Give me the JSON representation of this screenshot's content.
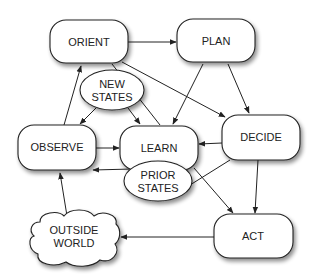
{
  "diagram": {
    "type": "flow",
    "nodes": {
      "orient": {
        "label": "ORIENT",
        "shape": "rounded-rect"
      },
      "plan": {
        "label": "PLAN",
        "shape": "rounded-rect"
      },
      "new_states": {
        "label_line1": "NEW",
        "label_line2": "STATES",
        "shape": "ellipse"
      },
      "observe": {
        "label": "OBSERVE",
        "shape": "rounded-rect"
      },
      "learn": {
        "label": "LEARN",
        "shape": "rounded-rect"
      },
      "decide": {
        "label": "DECIDE",
        "shape": "rounded-rect"
      },
      "prior_states": {
        "label_line1": "PRIOR",
        "label_line2": "STATES",
        "shape": "ellipse"
      },
      "outside_world": {
        "label_line1": "OUTSIDE",
        "label_line2": "WORLD",
        "shape": "cloud"
      },
      "act": {
        "label": "ACT",
        "shape": "rounded-rect"
      }
    },
    "edges": [
      {
        "from": "ORIENT",
        "to": "PLAN"
      },
      {
        "from": "ORIENT",
        "to": "DECIDE"
      },
      {
        "from": "ORIENT",
        "to": "LEARN"
      },
      {
        "from": "PLAN",
        "to": "LEARN"
      },
      {
        "from": "PLAN",
        "to": "DECIDE"
      },
      {
        "from": "NEW STATES",
        "to": "OBSERVE"
      },
      {
        "from": "NEW STATES",
        "to": "LEARN"
      },
      {
        "from": "OBSERVE",
        "to": "ORIENT"
      },
      {
        "from": "OBSERVE",
        "to": "LEARN"
      },
      {
        "from": "DECIDE",
        "to": "LEARN"
      },
      {
        "from": "DECIDE",
        "to": "PRIOR STATES"
      },
      {
        "from": "DECIDE",
        "to": "ACT"
      },
      {
        "from": "LEARN",
        "to": "ACT"
      },
      {
        "from": "PRIOR STATES",
        "to": "OBSERVE"
      },
      {
        "from": "OUTSIDE WORLD",
        "to": "OBSERVE"
      },
      {
        "from": "ACT",
        "to": "OUTSIDE WORLD"
      }
    ],
    "colors": {
      "stroke": "#222222",
      "fill": "#ffffff",
      "text": "#222222",
      "shadow": "#999999"
    }
  }
}
